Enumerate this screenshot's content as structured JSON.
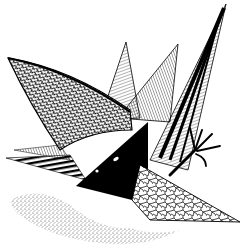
{
  "image": {
    "kind": "pen-and-ink illustration",
    "palette": {
      "ink": "#000000",
      "paper": "#ffffff",
      "mid": "#555555",
      "light": "#9a9a9a"
    },
    "subject": "abstract creature of spiky triangular shards with a clawed foot",
    "elements": [
      {
        "name": "left-textured-wing",
        "texture": "scale-like crosshatch"
      },
      {
        "name": "center-tall-spike",
        "texture": "fine hatching"
      },
      {
        "name": "right-striped-spike",
        "texture": "dark parallel stripes"
      },
      {
        "name": "black-triangle-face",
        "texture": "solid black with two white eyes"
      },
      {
        "name": "cracked-lower-shard",
        "texture": "crackle / cell pattern"
      },
      {
        "name": "clawed-foot",
        "texture": "ink line"
      },
      {
        "name": "striped-left-shard",
        "texture": "bold stripes"
      },
      {
        "name": "ground-debris",
        "texture": "stipple"
      }
    ]
  }
}
